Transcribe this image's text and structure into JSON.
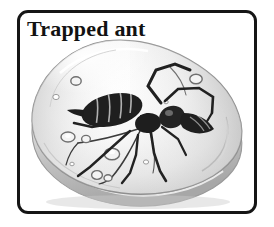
{
  "figure": {
    "title": "Trapped ant",
    "kind": "illustration",
    "medium": "grayscale pencil / halftone drawing",
    "frame": {
      "style": "rounded rectangle",
      "border_color": "#151515",
      "border_width_px": 3,
      "corner_radius_px": 11,
      "background_color": "#ffffff"
    },
    "title_style": {
      "font": "bold serif",
      "color": "#121212",
      "position": "top-left inside frame"
    }
  },
  "illustration": {
    "amber": {
      "label": "amber-blob",
      "shape": "rounded triangular pebble",
      "fill_light": "#fbfbfb",
      "fill_mid": "#e9e9e9",
      "fill_shadow": "#bdbdbd",
      "outline_color": "#8c8c8c",
      "rim_highlight": "#ffffff",
      "description": "translucent pale grey resin with a thick 3D bottom rim"
    },
    "ant": {
      "label": "trapped-ant",
      "color": "#1d1d1d",
      "parts": [
        "abdomen (segmented, striped)",
        "petiole",
        "thorax",
        "head",
        "mandibles",
        "antenna-left (elbowed)",
        "antenna-right (elbowed)",
        "leg-front-left",
        "leg-front-right",
        "leg-mid-left",
        "leg-mid-right",
        "leg-hind-left",
        "leg-hind-right"
      ],
      "orientation": "head to the right, abdomen to the left"
    },
    "inclusions": {
      "label": "air-bubbles",
      "count": 12,
      "ring_color": "#6f6f6f",
      "description": "small circular air bubbles suspended in the resin"
    },
    "cracks": {
      "label": "internal-cracks",
      "count": 4,
      "color": "#3c3c3c",
      "description": "fine dark fracture lines radiating through the resin"
    }
  }
}
